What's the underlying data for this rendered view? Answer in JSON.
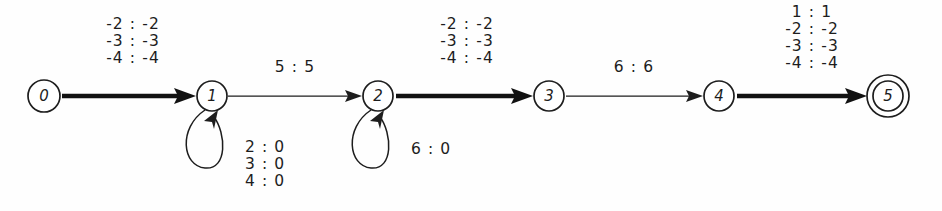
{
  "figure": {
    "name": "weighted-transducer-automaton",
    "type": "state-transition-diagram",
    "background_color": "#fefefe",
    "ink_color": "#1d1d1d"
  },
  "states": [
    {
      "id": "0",
      "label": "0",
      "cx": 44,
      "cy": 96,
      "r": 16,
      "kind": "initial"
    },
    {
      "id": "1",
      "label": "1",
      "cx": 212,
      "cy": 96,
      "r": 15,
      "kind": "normal"
    },
    {
      "id": "2",
      "label": "2",
      "cx": 378,
      "cy": 96,
      "r": 15,
      "kind": "normal"
    },
    {
      "id": "3",
      "label": "3",
      "cx": 549,
      "cy": 96,
      "r": 15,
      "kind": "normal"
    },
    {
      "id": "4",
      "label": "4",
      "cx": 719,
      "cy": 96,
      "r": 15,
      "kind": "normal"
    },
    {
      "id": "5",
      "label": "5",
      "cx": 888,
      "cy": 96,
      "r": 15,
      "kind": "accepting",
      "outer_r": 21
    }
  ],
  "transitions": [
    {
      "id": "t0-1",
      "from": "0",
      "to": "1",
      "weight": "thick",
      "label_x": 133,
      "label_y": 29,
      "labels": [
        "-2 : -2",
        "-3 : -3",
        "-4 : -4"
      ]
    },
    {
      "id": "t1-2",
      "from": "1",
      "to": "2",
      "weight": "thin",
      "label_x": 295,
      "label_y": 72,
      "labels": [
        "5 : 5"
      ]
    },
    {
      "id": "t2-3",
      "from": "2",
      "to": "3",
      "weight": "thick",
      "label_x": 467,
      "label_y": 29,
      "labels": [
        "-2 : -2",
        "-3 : -3",
        "-4 : -4"
      ]
    },
    {
      "id": "t3-4",
      "from": "3",
      "to": "4",
      "weight": "thin",
      "label_x": 634,
      "label_y": 72,
      "labels": [
        "6 : 6"
      ]
    },
    {
      "id": "t4-5",
      "from": "4",
      "to": "5",
      "weight": "thick",
      "label_x": 812,
      "label_y": 14,
      "labels": [
        "1 : 1",
        "-2 : -2",
        "-3 : -3",
        "-4 : -4"
      ]
    }
  ],
  "self_loops": [
    {
      "id": "loop-1",
      "state": "1",
      "label_x": 245,
      "label_y": 149,
      "labels": [
        "2 : 0",
        "3 : 0",
        "4 : 0"
      ]
    },
    {
      "id": "loop-2",
      "state": "2",
      "label_x": 411,
      "label_y": 152,
      "labels": [
        "6 : 0"
      ]
    }
  ]
}
